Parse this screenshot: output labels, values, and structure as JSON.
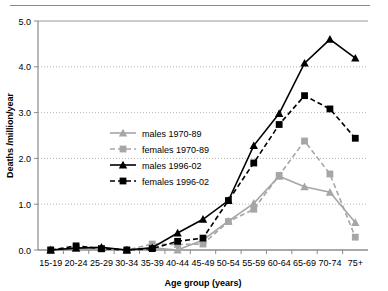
{
  "figure": {
    "top_rule": "horizontal-rule",
    "background_color": "#ffffff"
  },
  "chart_data": {
    "type": "line",
    "title": "",
    "xlabel": "Age group (years)",
    "ylabel": "Deaths /million/year",
    "categories": [
      "15-19",
      "20-24",
      "25-29",
      "30-34",
      "35-39",
      "40-44",
      "45-49",
      "50-54",
      "55-59",
      "60-64",
      "65-69",
      "70-74",
      "75+"
    ],
    "ylim": [
      0.0,
      5.0
    ],
    "yticks": [
      "0.0",
      "1.0",
      "2.0",
      "3.0",
      "4.0",
      "5.0"
    ],
    "ytick_values": [
      0.0,
      1.0,
      2.0,
      3.0,
      4.0,
      5.0
    ],
    "grid": "horizontal-dotted",
    "legend_position": "center-left-inside",
    "series": [
      {
        "name": "males 1970-89",
        "color": "#a6a6a6",
        "marker": "triangle",
        "linestyle": "solid",
        "values": [
          0.0,
          0.03,
          0.03,
          0.0,
          0.05,
          0.0,
          0.22,
          0.63,
          1.02,
          1.61,
          1.38,
          1.26,
          0.6
        ]
      },
      {
        "name": "females 1970-89",
        "color": "#a6a6a6",
        "marker": "square",
        "linestyle": "dashed",
        "values": [
          0.0,
          0.05,
          0.02,
          0.0,
          0.13,
          0.12,
          0.13,
          0.62,
          0.89,
          1.63,
          2.38,
          1.66,
          0.28
        ]
      },
      {
        "name": "males 1996-02",
        "color": "#000000",
        "marker": "triangle",
        "linestyle": "solid",
        "values": [
          0.0,
          0.04,
          0.06,
          0.0,
          0.05,
          0.37,
          0.67,
          1.08,
          2.28,
          2.98,
          4.08,
          4.6,
          4.19
        ]
      },
      {
        "name": "females 1996-02",
        "color": "#000000",
        "marker": "square",
        "linestyle": "dashed",
        "values": [
          0.0,
          0.09,
          0.03,
          0.0,
          0.03,
          0.19,
          0.26,
          1.08,
          1.9,
          2.74,
          3.37,
          3.08,
          2.44
        ]
      }
    ]
  }
}
